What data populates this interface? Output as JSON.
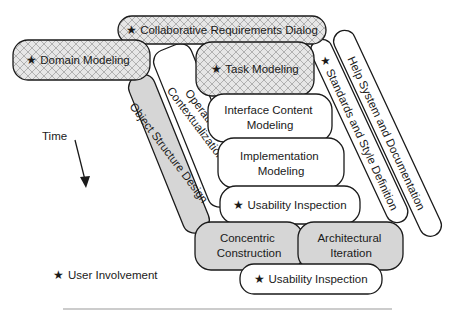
{
  "diagram": {
    "type": "process-activity-model",
    "colors": {
      "outline": "#1a1a1a",
      "gray_fill": "#d6d6d6",
      "hatch_fill": "#e6e6e6",
      "hatch_line": "#9a9a9a",
      "white_fill": "#ffffff",
      "rule": "#999999"
    },
    "activities": {
      "collaborative_requirements": {
        "label": "Collaborative Requirements Dialog",
        "user_involvement": true,
        "fill": "hatched"
      },
      "domain_modeling": {
        "label": "Domain Modeling",
        "user_involvement": true,
        "fill": "hatched"
      },
      "task_modeling": {
        "label": "Task Modeling",
        "user_involvement": true,
        "fill": "hatched"
      },
      "operational_contextualization": {
        "line1": "Operational",
        "line2": "Contextualization",
        "fill": "white"
      },
      "object_structure_design": {
        "label": "Object Structure Design",
        "fill": "gray"
      },
      "interface_content_modeling": {
        "line1": "Interface Content",
        "line2": "Modeling",
        "fill": "white"
      },
      "implementation_modeling": {
        "line1": "Implementation",
        "line2": "Modeling",
        "fill": "white"
      },
      "usability_inspection_1": {
        "label": "Usability Inspection",
        "user_involvement": true,
        "fill": "white"
      },
      "concentric_construction": {
        "line1": "Concentric",
        "line2": "Construction",
        "fill": "gray"
      },
      "architectural_iteration": {
        "line1": "Architectural",
        "line2": "Iteration",
        "fill": "gray"
      },
      "usability_inspection_2": {
        "label": "Usability Inspection",
        "user_involvement": true,
        "fill": "white"
      },
      "standards_style": {
        "label": "Standards and Style Definition",
        "user_involvement": true,
        "fill": "white"
      },
      "help_system": {
        "label": "Help System and Documentation",
        "fill": "white"
      }
    },
    "time_axis": {
      "label": "Time"
    },
    "legend": {
      "star": "★",
      "label": "User Involvement"
    }
  }
}
